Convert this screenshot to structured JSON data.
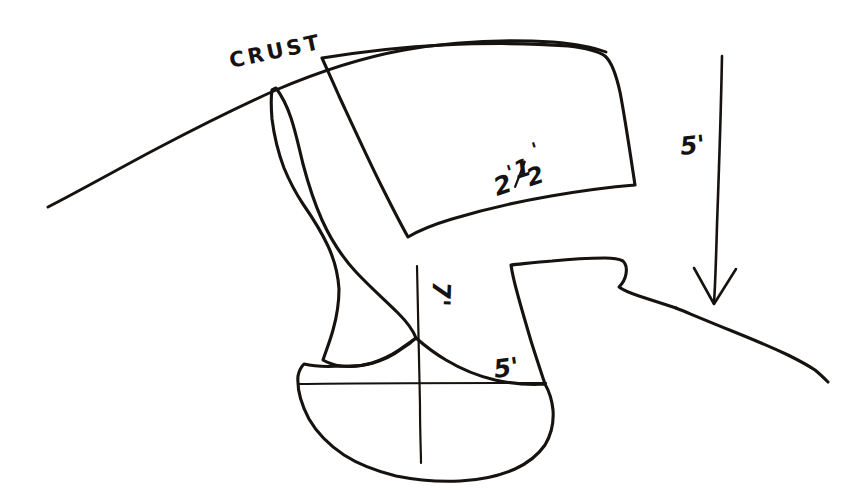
{
  "figure": {
    "background_color": "#ffffff",
    "ink_color": "#15120f",
    "medium": "pen on white paper"
  },
  "labels": {
    "crust": "CRUST",
    "block_width": "2",
    "block_width_fraction_numerator": "1",
    "block_width_fraction_denominator": "2",
    "block_width_prime": "'",
    "block_width_full": "2 1/2'",
    "arrow_depth": "5'",
    "chamber_width": "5'",
    "neck_height": "7'"
  },
  "annotations": [
    {
      "name": "crust-label",
      "text": "CRUST",
      "x": 231,
      "y": 68,
      "rotation": -12,
      "description": "label on the ground-surface arc"
    },
    {
      "name": "block-width-label",
      "text": "2 1/2'",
      "x": 497,
      "y": 196,
      "rotation": -18,
      "description": "dimension along lower edge of upper block"
    },
    {
      "name": "depth-arrow-label",
      "text": "5'",
      "x": 681,
      "y": 155,
      "rotation": 0,
      "description": "depth dimension beside vertical arrow"
    },
    {
      "name": "chamber-width-label",
      "text": "5'",
      "x": 495,
      "y": 378,
      "rotation": 0,
      "description": "width dimension above horizontal chamber line"
    },
    {
      "name": "neck-height-label",
      "text": "7'",
      "x": 433,
      "y": 281,
      "rotation": 92,
      "description": "rotated height dimension beside vertical chamber line"
    }
  ],
  "shapes": [
    {
      "name": "crust-arc",
      "type": "open-curve",
      "description": "ground surface arc sweeping up from lower-left to the right"
    },
    {
      "name": "upper-block",
      "type": "closed-quadrilateral",
      "description": "large four-sided block below the crust on the right"
    },
    {
      "name": "neck-channel",
      "type": "closed-irregular",
      "description": "narrow winding vertical channel from crust down to chamber"
    },
    {
      "name": "lower-chamber",
      "type": "closed-irregular",
      "description": "bulbous rounded chamber at the bottom"
    },
    {
      "name": "right-wall",
      "type": "open-polyline",
      "description": "stepped wall descending to the right of the chamber"
    },
    {
      "name": "right-slope",
      "type": "open-polyline",
      "description": "descending ground slope on the far right"
    },
    {
      "name": "depth-arrow",
      "type": "arrow",
      "direction": "down",
      "description": "long vertical arrow pointing down on the right"
    },
    {
      "name": "chamber-horizontal-line",
      "type": "line",
      "description": "horizontal measurement line across the chamber"
    },
    {
      "name": "chamber-vertical-line",
      "type": "line",
      "description": "vertical measurement line through the chamber"
    }
  ]
}
